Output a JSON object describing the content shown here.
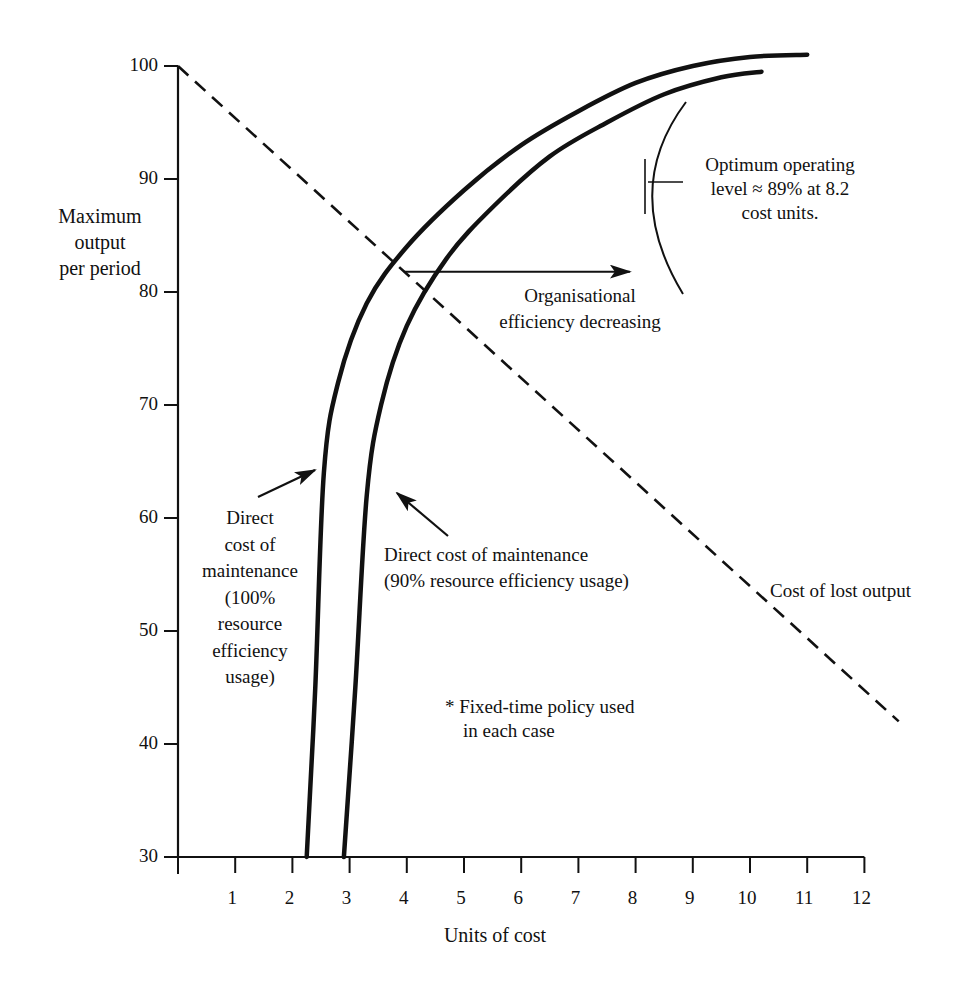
{
  "chart_data": {
    "type": "line",
    "title": "",
    "xlabel": "Units of cost",
    "ylabel": "Maximum output per period",
    "xlim": [
      0,
      12
    ],
    "ylim": [
      30,
      100
    ],
    "x_ticks": [
      "1",
      "2",
      "3",
      "4",
      "5",
      "6",
      "7",
      "8",
      "9",
      "10",
      "11",
      "12"
    ],
    "y_ticks": [
      "30",
      "40",
      "50",
      "60",
      "70",
      "80",
      "90",
      "100"
    ],
    "grid": false,
    "series": [
      {
        "name": "Direct cost of maintenance (100% resource efficiency usage)",
        "style": "solid-thick",
        "points": [
          [
            2.25,
            30
          ],
          [
            2.4,
            45
          ],
          [
            2.55,
            64
          ],
          [
            2.8,
            72
          ],
          [
            3.3,
            79
          ],
          [
            4.0,
            84
          ],
          [
            5.0,
            89
          ],
          [
            6.0,
            93
          ],
          [
            7.0,
            96
          ],
          [
            8.0,
            98.5
          ],
          [
            9.0,
            100
          ],
          [
            10.0,
            100.8
          ],
          [
            11.0,
            101
          ]
        ]
      },
      {
        "name": "Direct cost of maintenance (90% resource efficiency usage)",
        "style": "solid-thick",
        "points": [
          [
            2.9,
            30
          ],
          [
            3.1,
            45
          ],
          [
            3.3,
            62
          ],
          [
            3.55,
            70
          ],
          [
            4.0,
            77
          ],
          [
            4.7,
            83
          ],
          [
            5.5,
            87.5
          ],
          [
            6.5,
            92
          ],
          [
            7.5,
            95
          ],
          [
            8.5,
            97.5
          ],
          [
            9.5,
            99
          ],
          [
            10.2,
            99.5
          ]
        ]
      },
      {
        "name": "Cost of lost output",
        "style": "dashed",
        "points": [
          [
            0,
            100
          ],
          [
            12.6,
            42
          ]
        ]
      }
    ],
    "annotations": [
      {
        "id": "optimum",
        "text": "Optimum operating level ≈ 89% at 8.2 cost units."
      },
      {
        "id": "org_eff",
        "text": "Organisational efficiency decreasing",
        "arrow": {
          "from": [
            3.95,
            81.8
          ],
          "to": [
            7.9,
            81.8
          ]
        }
      },
      {
        "id": "dc100",
        "text": "Direct cost of maintenance (100% resource efficiency usage)"
      },
      {
        "id": "dc90",
        "text": "Direct cost of maintenance (90% resource efficiency usage)"
      },
      {
        "id": "lost",
        "text": "Cost of lost output"
      },
      {
        "id": "note",
        "text": "* Fixed-time policy used in each case"
      }
    ]
  },
  "labels": {
    "ylabel_lines": [
      "Maximum",
      "output",
      "per period"
    ],
    "xlabel": "Units of cost",
    "optimum_lines": [
      "Optimum operating",
      "level ≈ 89% at 8.2",
      "cost units."
    ],
    "org_lines": [
      "Organisational",
      "efficiency decreasing"
    ],
    "dc100_lines": [
      "Direct",
      "cost of",
      "maintenance",
      "(100%",
      "resource",
      "efficiency",
      "usage)"
    ],
    "dc90_lines": [
      "Direct cost of maintenance",
      "(90% resource efficiency usage)"
    ],
    "lost": "Cost of lost output",
    "note_lines": [
      "* Fixed-time policy used",
      "in each case"
    ]
  },
  "colors": {
    "ink": "#111111",
    "background": "#ffffff"
  }
}
